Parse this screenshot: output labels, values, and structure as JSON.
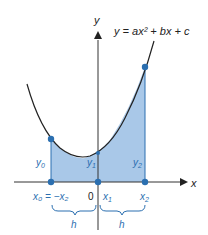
{
  "diagram": {
    "equation": "y = ax² + bx + c",
    "axes": {
      "x_label": "x",
      "y_label": "y",
      "origin_label": "0"
    },
    "ordinates": {
      "y0": "y",
      "y0_sub": "0",
      "y1": "y",
      "y1_sub": "1",
      "y2": "y",
      "y2_sub": "2"
    },
    "abscissas": {
      "x0": "x₀ = −x₂",
      "x1": "x",
      "x1_sub": "1",
      "x2": "x",
      "x2_sub": "2"
    },
    "widths": {
      "left": "h",
      "right": "h"
    },
    "colors": {
      "fill": "#a9c8e8",
      "accent": "#2b6fb0",
      "curve": "#222222"
    }
  }
}
